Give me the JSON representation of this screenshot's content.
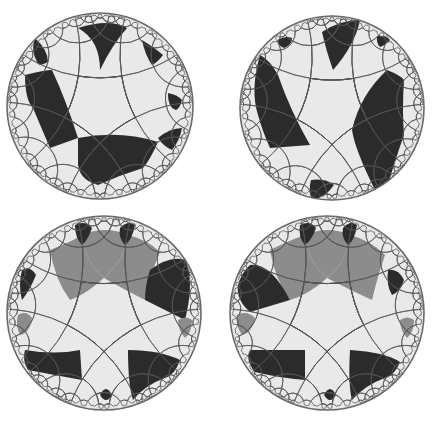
{
  "figure": {
    "colors": {
      "background": "#ffffff",
      "light": "#e9e9e9",
      "dark": "#2b2b2b",
      "gray": "#8c8c8c",
      "line": "#555555",
      "rim": "#6a6a6a"
    },
    "panels": [
      {
        "id": "top-left",
        "cx": 100,
        "cy": 106,
        "r": 93,
        "rotation": 0,
        "regions": [
          {
            "fill": "dark",
            "d": "M78,28 Q100,40 100,70 Q112,45 127,28 Q110,18 78,28 Z"
          },
          {
            "fill": "dark",
            "d": "M35,38 Q48,50 48,62 Q40,66 38,64 Q30,50 35,38 Z"
          },
          {
            "fill": "dark",
            "d": "M142,40 Q155,48 163,55 Q158,62 152,65 Q145,55 142,40 Z"
          },
          {
            "fill": "dark",
            "d": "M25,75 Q45,70 52,70 Q66,100 78,138 L50,148 Q38,120 33,108 Q25,100 25,75 Z"
          },
          {
            "fill": "dark",
            "d": "M78,138 Q120,130 158,142 Q150,160 143,168 Q120,175 98,185 Q80,180 78,165 Z"
          },
          {
            "fill": "dark",
            "d": "M168,93 Q178,95 182,100 Q180,108 176,110 Q168,108 168,93 Z"
          },
          {
            "fill": "dark",
            "d": "M158,138 Q170,128 182,128 Q180,140 172,150 Q163,146 158,138 Z"
          }
        ]
      },
      {
        "id": "top-right",
        "cx": 332,
        "cy": 108,
        "r": 92,
        "rotation": 0,
        "regions": [
          {
            "fill": "dark",
            "d": "M322,32 Q340,20 360,20 Q355,45 333,70 Q326,50 322,32 Z"
          },
          {
            "fill": "dark",
            "d": "M278,40 Q285,35 292,38 Q292,45 284,48 Q278,46 278,40 Z"
          },
          {
            "fill": "dark",
            "d": "M377,36 Q385,35 390,40 Q386,45 380,47 Q376,43 377,36 Z"
          },
          {
            "fill": "dark",
            "d": "M260,55 Q270,60 278,75 Q290,110 310,145 L270,148 Q262,130 258,115 Q250,90 260,55 Z"
          },
          {
            "fill": "dark",
            "d": "M387,70 Q400,75 404,80 Q402,110 404,135 Q395,160 385,195 Q378,198 375,190 Q355,150 352,130 Q360,95 387,70 Z"
          },
          {
            "fill": "dark",
            "d": "M311,180 Q325,178 334,185 Q325,198 312,200 Q308,190 311,180 Z"
          }
        ]
      },
      {
        "id": "bottom-left",
        "cx": 104,
        "cy": 313,
        "r": 97,
        "rotation": 0,
        "regions": [
          {
            "fill": "gray",
            "d": "M82,235 Q105,225 128,235 Q125,260 104,278 Q85,262 82,235 Z"
          },
          {
            "fill": "gray",
            "d": "M50,250 Q75,240 82,235 Q85,262 104,278 Q85,295 70,300 Q55,280 50,250 Z"
          },
          {
            "fill": "gray",
            "d": "M128,235 Q148,240 160,252 Q150,275 145,300 Q125,290 104,278 Q125,260 128,235 Z"
          },
          {
            "fill": "dark",
            "d": "M75,225 Q85,220 92,228 Q88,240 82,245 Q75,238 75,225 Z"
          },
          {
            "fill": "dark",
            "d": "M120,228 Q128,220 135,225 Q132,240 125,245 Q118,238 120,228 Z"
          },
          {
            "fill": "dark",
            "d": "M150,270 Q170,255 185,260 Q195,280 185,320 L145,300 Q145,285 150,270 Z"
          },
          {
            "fill": "dark",
            "d": "M22,270 Q30,265 36,275 Q30,290 22,300 Q18,285 22,270 Z"
          },
          {
            "fill": "dark",
            "d": "M25,350 Q55,355 80,350 L82,380 Q60,376 28,370 Q22,360 25,350 Z"
          },
          {
            "fill": "dark",
            "d": "M128,350 Q160,350 180,360 Q175,375 165,378 Q145,385 133,400 Q128,385 128,350 Z"
          },
          {
            "fill": "dark",
            "d": "M100,395 Q106,383 112,395 Q106,405 100,395 Z"
          },
          {
            "fill": "gray",
            "d": "M18,315 Q26,310 32,318 Q30,333 20,335 Q15,325 18,315 Z"
          },
          {
            "fill": "gray",
            "d": "M178,320 Q186,315 192,320 Q192,332 185,338 Q178,330 178,320 Z"
          }
        ]
      },
      {
        "id": "bottom-right",
        "cx": 327,
        "cy": 313,
        "r": 97,
        "rotation": 0,
        "regions": [
          {
            "fill": "gray",
            "d": "M305,235 Q328,225 350,235 Q348,260 327,278 Q308,262 305,235 Z"
          },
          {
            "fill": "gray",
            "d": "M270,250 Q290,240 305,235 Q308,262 327,278 Q308,295 290,300 Q275,280 270,250 Z"
          },
          {
            "fill": "gray",
            "d": "M350,235 Q370,240 385,255 Q378,275 372,300 Q350,290 327,278 Q348,260 350,235 Z"
          },
          {
            "fill": "dark",
            "d": "M300,225 Q310,220 316,228 Q312,240 305,245 Q298,238 300,225 Z"
          },
          {
            "fill": "dark",
            "d": "M343,228 Q350,220 357,225 Q355,240 348,245 Q341,238 343,228 Z"
          },
          {
            "fill": "dark",
            "d": "M250,265 Q270,262 290,300 L250,312 Q236,300 238,285 Q242,272 250,265 Z"
          },
          {
            "fill": "dark",
            "d": "M388,270 Q398,268 404,280 Q400,292 392,295 Q386,285 388,270 Z"
          },
          {
            "fill": "dark",
            "d": "M250,350 Q280,350 305,350 L305,380 Q280,378 255,372 Q245,360 250,350 Z"
          },
          {
            "fill": "dark",
            "d": "M350,350 Q385,352 400,362 Q395,375 385,378 Q365,385 352,400 Q348,385 350,350 Z"
          },
          {
            "fill": "dark",
            "d": "M324,395 Q330,383 336,395 Q330,405 324,395 Z"
          },
          {
            "fill": "gray",
            "d": "M237,315 Q247,310 255,318 Q252,333 242,335 Q235,325 237,315 Z"
          },
          {
            "fill": "gray",
            "d": "M400,320 Q408,315 414,320 Q414,332 407,338 Q400,330 400,320 Z"
          }
        ]
      }
    ]
  }
}
